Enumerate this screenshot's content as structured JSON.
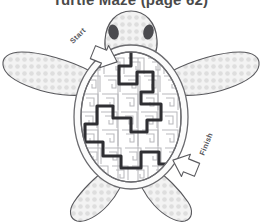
{
  "page": {
    "title": "Turtle Maze (page 62)",
    "title_clipped": true,
    "background_color": "#ffffff"
  },
  "colors": {
    "outline": "#58585c",
    "skin_fill": "#f2f2f2",
    "skin_dot": "#dedede",
    "eye": "#4b4b4f",
    "shell_rim": "#6a6a6e",
    "maze_wall": "#b9b9bd",
    "solution_path": "#2f2f33",
    "label_text": "#55555a",
    "arrow_fill": "#ffffff",
    "arrow_stroke": "#5a5a5e"
  },
  "figure": {
    "name": "turtle-maze",
    "parts": [
      {
        "id": "head",
        "label": "turtle-head",
        "texture": "dotted"
      },
      {
        "id": "front-flipper-left",
        "label": "front-left-flipper",
        "texture": "dotted"
      },
      {
        "id": "front-flipper-right",
        "label": "front-right-flipper",
        "texture": "dotted"
      },
      {
        "id": "rear-flipper-left",
        "label": "rear-left-flipper",
        "texture": "dotted"
      },
      {
        "id": "rear-flipper-right",
        "label": "rear-right-flipper",
        "texture": "dotted"
      },
      {
        "id": "shell",
        "label": "turtle-shell-maze",
        "texture": "maze"
      }
    ]
  },
  "annotations": {
    "start": {
      "text": "Start",
      "rotation_deg": -45,
      "arrow_direction": "down-right",
      "points_to": "maze entrance at top of shell"
    },
    "finish": {
      "text": "Finish",
      "rotation_deg": -68,
      "arrow_direction": "down-left",
      "points_to": "maze exit at lower right of shell"
    }
  },
  "maze": {
    "type": "spiral-motif maze",
    "wall_style": "thin light-gray squared spirals",
    "solution": {
      "visible": true,
      "style": "bold dark traced line",
      "from": "start",
      "to": "finish"
    }
  }
}
